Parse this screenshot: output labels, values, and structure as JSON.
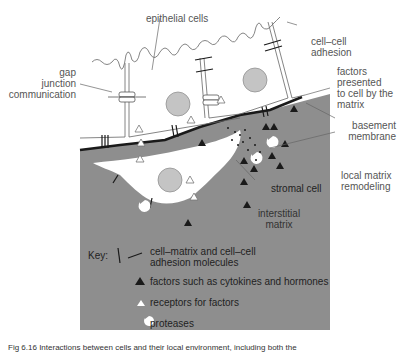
{
  "diagram": {
    "labels": {
      "epithelial_cells": "epithelial cells",
      "cell_cell_adhesion": [
        "cell–cell",
        "adhesion"
      ],
      "gap_junction": [
        "gap",
        "junction",
        "communication"
      ],
      "factors_presented": [
        "factors",
        "presented",
        "to cell by the",
        "matrix"
      ],
      "basement_membrane": [
        "basement",
        "membrane"
      ],
      "local_matrix_remodeling": [
        "local matrix",
        "remodeling"
      ],
      "stromal_cell": "stromal cell",
      "interstitial_matrix": [
        "interstitial",
        "matrix"
      ]
    },
    "key": {
      "title": "Key:",
      "items": [
        {
          "icon": "adhesion-molecule-icon",
          "label": [
            "cell–matrix and cell–cell",
            "adhesion molecules"
          ]
        },
        {
          "icon": "filled-triangle-icon",
          "label": [
            "factors such as cytokines and hormones"
          ]
        },
        {
          "icon": "open-triangle-icon",
          "label": [
            "receptors for factors"
          ]
        },
        {
          "icon": "protease-icon",
          "label": [
            "proteases"
          ]
        }
      ]
    },
    "caption": "Fig 6.16  Interactions between cells and their local environment, including both the",
    "colors": {
      "matrix": "#8e8e8e",
      "nucleus": "#c4c4c4",
      "line": "#555555",
      "membrane": "#1a1a1a",
      "background": "#ffffff"
    }
  }
}
